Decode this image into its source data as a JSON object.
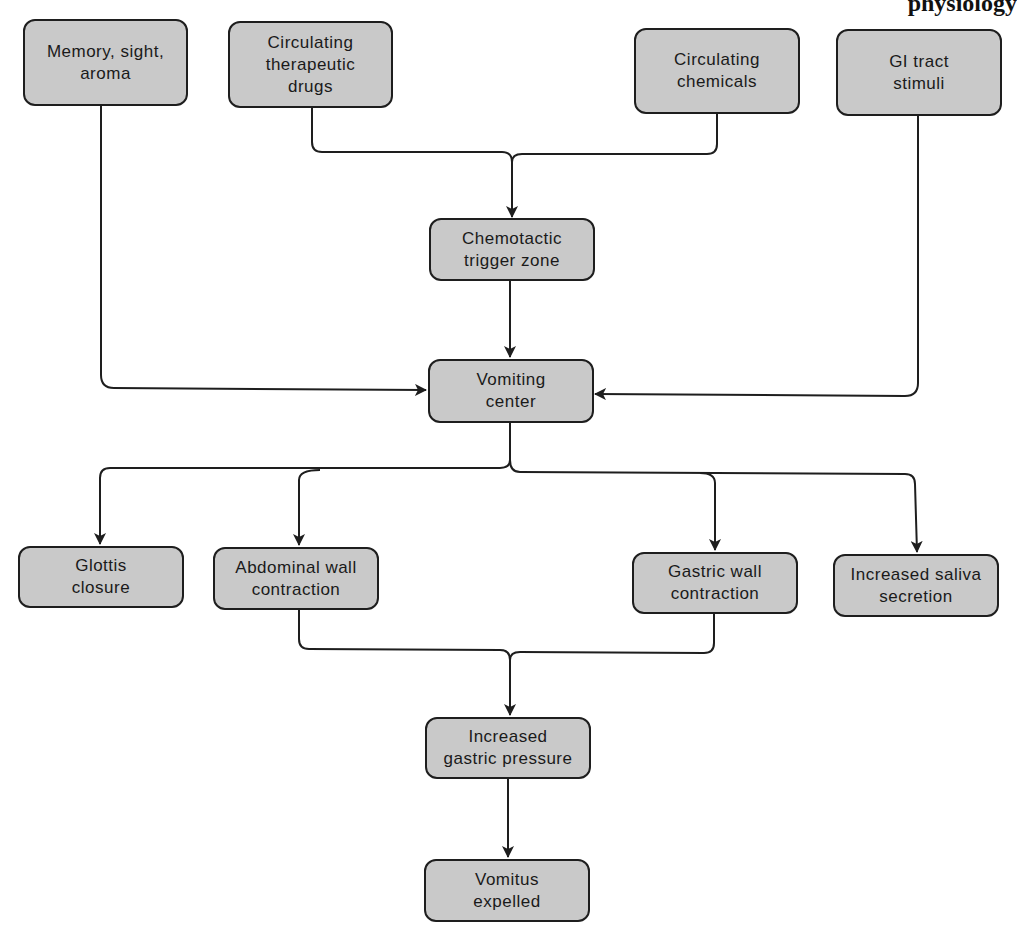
{
  "header": {
    "fragment": "physiology"
  },
  "colors": {
    "node_fill": "#c9c9c9",
    "node_border": "#1e1e1e",
    "line": "#1e1e1e",
    "background": "#ffffff"
  },
  "nodes": {
    "memory": "Memory, sight,\naroma",
    "drugs": "Circulating\ntherapeutic\ndrugs",
    "chemicals": "Circulating\nchemicals",
    "gi": "GI tract\nstimuli",
    "ctz": "Chemotactic\ntrigger zone",
    "vomiting_center": "Vomiting\ncenter",
    "glottis": "Glottis\nclosure",
    "abdominal": "Abdominal wall\ncontraction",
    "gastric": "Gastric wall\ncontraction",
    "saliva": "Increased saliva\nsecretion",
    "pressure": "Increased\ngastric pressure",
    "vomitus": "Vomitus\nexpelled"
  },
  "edges": [
    [
      "Circulating therapeutic drugs",
      "Chemotactic trigger zone"
    ],
    [
      "Circulating chemicals",
      "Chemotactic trigger zone"
    ],
    [
      "Chemotactic trigger zone",
      "Vomiting center"
    ],
    [
      "Memory, sight, aroma",
      "Vomiting center"
    ],
    [
      "GI tract stimuli",
      "Vomiting center"
    ],
    [
      "Vomiting center",
      "Glottis closure"
    ],
    [
      "Vomiting center",
      "Abdominal wall contraction"
    ],
    [
      "Vomiting center",
      "Gastric wall contraction"
    ],
    [
      "Vomiting center",
      "Increased saliva secretion"
    ],
    [
      "Abdominal wall contraction",
      "Increased gastric pressure"
    ],
    [
      "Gastric wall contraction",
      "Increased gastric pressure"
    ],
    [
      "Increased gastric pressure",
      "Vomitus expelled"
    ]
  ]
}
